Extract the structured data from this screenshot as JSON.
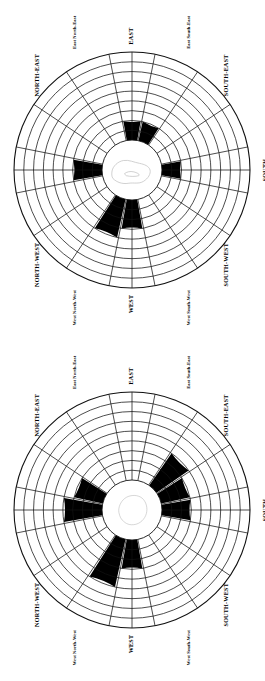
{
  "figure": {
    "type": "wind-rose-pair",
    "orientation_note": "Both roses and all labels are rotated 90 degrees counter-clockwise on the page",
    "rings": 9,
    "sectors": 16,
    "colors": {
      "petal": "#000000",
      "grid": "#111111",
      "background": "#ffffff",
      "map_outline": "#b9b9b9"
    }
  },
  "directions": [
    {
      "key": "N",
      "label": "NORTH",
      "style": "major",
      "angle": 0
    },
    {
      "key": "NNE",
      "label": "North North-East",
      "style": "minor",
      "angle": 22.5
    },
    {
      "key": "NE",
      "label": "NORTH-EAST",
      "style": "major",
      "angle": 45
    },
    {
      "key": "ENE",
      "label": "East North-East",
      "style": "minor",
      "angle": 67.5
    },
    {
      "key": "E",
      "label": "EAST",
      "style": "major",
      "angle": 90
    },
    {
      "key": "ESE",
      "label": "East South-East",
      "style": "minor",
      "angle": 112.5
    },
    {
      "key": "SE",
      "label": "SOUTH-EAST",
      "style": "major",
      "angle": 135
    },
    {
      "key": "SSE",
      "label": "South South-East",
      "style": "minor",
      "angle": 157.5
    },
    {
      "key": "S",
      "label": "SOUTH",
      "style": "major",
      "angle": 180
    },
    {
      "key": "SSW",
      "label": "South South-West",
      "style": "minor",
      "angle": 202.5
    },
    {
      "key": "SW",
      "label": "SOUTH-WEST",
      "style": "major",
      "angle": 225
    },
    {
      "key": "WSW",
      "label": "West South-West",
      "style": "minor",
      "angle": 247.5
    },
    {
      "key": "W",
      "label": "WEST",
      "style": "major",
      "angle": 270
    },
    {
      "key": "WNW",
      "label": "West North-West",
      "style": "minor",
      "angle": 292.5
    },
    {
      "key": "NW",
      "label": "NORTH-WEST",
      "style": "major",
      "angle": 315
    },
    {
      "key": "NNW",
      "label": "North North-West",
      "style": "minor",
      "angle": 337.5
    }
  ],
  "chart_data": [
    {
      "type": "bar",
      "subtype": "wind-rose",
      "title": "",
      "xlabel": "",
      "ylabel": "",
      "categories": [
        "N",
        "NNE",
        "NE",
        "ENE",
        "E",
        "ESE",
        "SE",
        "SSE",
        "S",
        "SSW",
        "SW",
        "WSW",
        "W",
        "WNW",
        "NW",
        "NNW"
      ],
      "values": [
        3,
        0,
        0,
        0,
        2,
        2,
        0,
        0,
        2,
        0,
        0,
        0,
        3,
        4,
        0,
        0
      ],
      "ylim": [
        0,
        9
      ],
      "grid": true,
      "legend": "none",
      "annotations": [
        "central map silhouette"
      ]
    },
    {
      "type": "bar",
      "subtype": "wind-rose",
      "title": "",
      "xlabel": "",
      "ylabel": "",
      "categories": [
        "N",
        "NNE",
        "NE",
        "ENE",
        "E",
        "ESE",
        "SE",
        "SSE",
        "S",
        "SSW",
        "SW",
        "WSW",
        "W",
        "WNW",
        "NW",
        "NNW"
      ],
      "values": [
        4,
        3,
        0,
        0,
        0,
        0,
        4,
        3,
        3,
        0,
        0,
        0,
        3,
        5,
        0,
        0
      ],
      "ylim": [
        0,
        9
      ],
      "grid": true,
      "legend": "none",
      "annotations": [
        "central map silhouette"
      ]
    }
  ],
  "roses": [
    {
      "id": "rose-1",
      "name": "wind-rose-top"
    },
    {
      "id": "rose-2",
      "name": "wind-rose-bottom"
    }
  ]
}
